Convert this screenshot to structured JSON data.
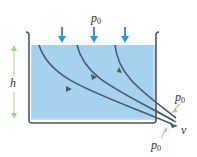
{
  "labels": {
    "top_pressure": {
      "symbol": "p",
      "subscript": "0"
    },
    "outlet_pressure_upper": {
      "symbol": "p",
      "subscript": "0"
    },
    "outlet_pressure_lower": {
      "symbol": "p",
      "subscript": "0"
    },
    "height": "h",
    "velocity": "v"
  },
  "colors": {
    "water": "#a6d2ef",
    "container": "#555555",
    "streamline": "#4a5a6a",
    "pressure_arrow": "#2a9be0",
    "green_arrow": "#9fd28a"
  }
}
